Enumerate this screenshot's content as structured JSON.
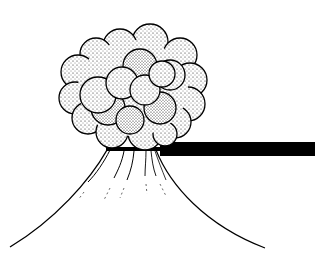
{
  "illustration": {
    "subject": "Explosion cloud erupting from a base with a horizontal bar (line-art stipple illustration)",
    "style": "black-and-white stippled line drawing",
    "colors": {
      "ink": "#000000",
      "paper": "#ffffff",
      "stipple": "#1a1a1a"
    },
    "parts": [
      "billowing-cloud",
      "horizontal-bar",
      "base-streaks"
    ]
  }
}
